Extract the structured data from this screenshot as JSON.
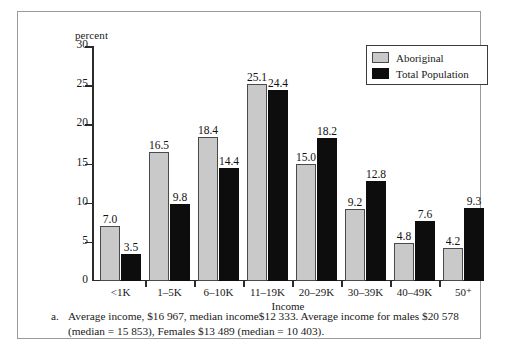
{
  "chart_data": {
    "type": "bar",
    "title": "",
    "subtitle": "",
    "xlabel": "Income",
    "ylabel": "percent",
    "categories": [
      "<1K",
      "1–5K",
      "6–10K",
      "11–19K",
      "20–29K",
      "30–39K",
      "40–49K",
      "50⁺"
    ],
    "series": [
      {
        "name": "Aboriginal",
        "color": "#c9c9c9",
        "values": [
          7.0,
          16.5,
          18.4,
          25.1,
          15.0,
          9.2,
          4.8,
          4.2
        ],
        "labels": [
          "7.0",
          "16.5",
          "18.4",
          "25.1",
          "15.0",
          "9.2",
          "4.8",
          "4.2"
        ]
      },
      {
        "name": "Total Population",
        "color": "#0d0d0d",
        "values": [
          3.5,
          9.8,
          14.4,
          24.4,
          18.2,
          12.8,
          7.6,
          9.3
        ],
        "labels": [
          "3.5",
          "9.8",
          "14.4",
          "24.4",
          "18.2",
          "12.8",
          "7.6",
          "9.3"
        ]
      }
    ],
    "ylim": [
      0,
      30
    ],
    "yticks": [
      0,
      5,
      10,
      15,
      20,
      25,
      30
    ],
    "ytick_labels": [
      "0",
      "5",
      "10",
      "15",
      "20",
      "25",
      "30"
    ],
    "grid": false,
    "legend_position": "top-right",
    "data_labels": true
  },
  "legend": {
    "entries": [
      {
        "label": "Aboriginal",
        "swatch": "aboriginal"
      },
      {
        "label": "Total Population",
        "swatch": "total"
      }
    ]
  },
  "footnote": {
    "marker": "a.",
    "text": "Average income, $16 967, median income$12 333. Average income for males $20 578 (median = 15 853), Females $13 489 (median = 10 403)."
  }
}
